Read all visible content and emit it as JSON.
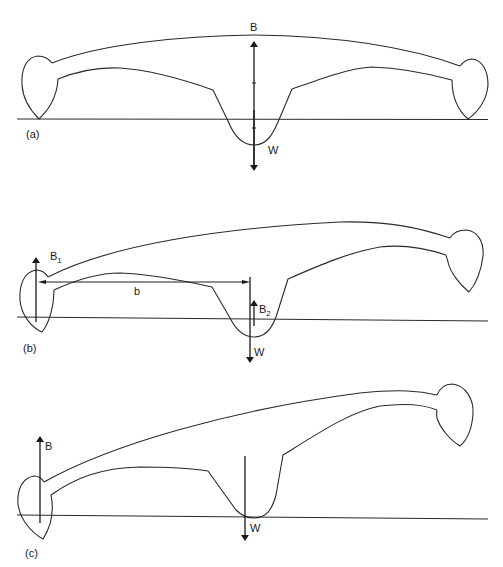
{
  "figure": {
    "panels": [
      {
        "id": "a",
        "caption": "(a)",
        "description": "Trimaran level, main hull supporting full weight",
        "labels": {
          "buoyancy": "B",
          "weight": "W"
        }
      },
      {
        "id": "b",
        "caption": "(b)",
        "description": "Heeled trimaran, buoyancy shared between float and main hull",
        "labels": {
          "buoyancy_float": "B",
          "buoyancy_float_sub": "1",
          "buoyancy_main": "B",
          "buoyancy_main_sub": "2",
          "weight": "W",
          "lever_arm": "b"
        }
      },
      {
        "id": "c",
        "caption": "(c)",
        "description": "Fully heeled, leeward float supporting all buoyancy",
        "labels": {
          "buoyancy": "B",
          "weight": "W"
        }
      }
    ],
    "colors": {
      "line": "#2a2a2a",
      "background": "#ffffff"
    }
  }
}
